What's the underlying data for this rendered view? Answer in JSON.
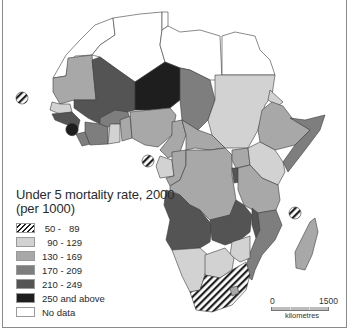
{
  "legend": {
    "title_line1": "Under 5 mortality rate, 2000",
    "title_line2": "(per 1000)",
    "items": [
      {
        "label": " 50 -   89",
        "fill": "hatch",
        "color": "#ffffff"
      },
      {
        "label": "  90 - 129",
        "fill": "solid",
        "color": "#d2d2d2"
      },
      {
        "label": "130 - 169",
        "fill": "solid",
        "color": "#a8a8a8"
      },
      {
        "label": "170 - 209",
        "fill": "solid",
        "color": "#7e7e7e"
      },
      {
        "label": "210 - 249",
        "fill": "solid",
        "color": "#545454"
      },
      {
        "label": "250 and above",
        "fill": "solid",
        "color": "#1e1e1e"
      },
      {
        "label": "No data",
        "fill": "solid",
        "color": "#ffffff"
      }
    ]
  },
  "scale_bar": {
    "min_label": "0",
    "max_label": "1500",
    "unit": "kilometres"
  },
  "map": {
    "subject": "Africa",
    "colors": {
      "c50": "url(#hatch)",
      "c90": "#d2d2d2",
      "c130": "#a8a8a8",
      "c170": "#7e7e7e",
      "c210": "#545454",
      "c250": "#1e1e1e",
      "nodata": "#ffffff",
      "border": "#3c3c3c"
    }
  }
}
